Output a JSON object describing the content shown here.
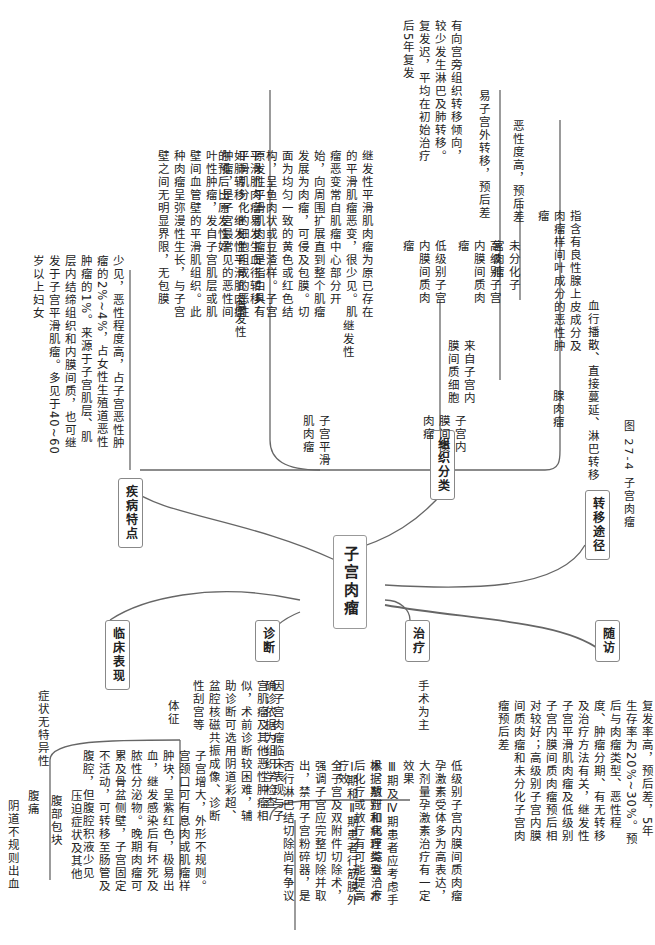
{
  "root": "子宫肉瘤",
  "caption": "图 27-4   子宫肉瘤",
  "branches": {
    "features": {
      "label": "疾病特点",
      "text": "少见，恶性程度高，占子宫恶性肿瘤的2%~4%，占女性生殖道恶性肿瘤的1%。来源于子宫肌层、肌层内结缔组织和内膜间质，也可继发于子宫平滑肌瘤。多见于40~60岁以上妇女"
    },
    "histology": {
      "label": "组织分类",
      "leiomyosarcoma": {
        "label": "子宫平滑肌肉瘤",
        "primary_label": "原发性",
        "primary_text": "原发性平滑肌肉瘤是指由具有平滑肌分化的细胞组成的恶性肿瘤，是子宫最常见的恶性间叶性肿瘤，发自子宫肌层或肌壁间血管壁的平滑肌组织。此种肉瘤呈弥漫性生长，与子宫壁之间无明显界限，无包膜",
        "secondary_label": "继发性",
        "secondary_text": "继发性平滑肌肉瘤为原已存在的平滑肌瘤恶变，很少见。肌瘤恶变常自肌瘤中心部分开始，向周围扩展直到整个肌瘤发展为肉瘤，可侵及包膜。切面为均匀一致的黄色或红色结构，呈鱼肉状或豆渣样。子宫平滑肌肉瘤易发生血行转移，如肺转移。继发性平滑肌肉瘤的预后比原发性好",
        "compare": [
          "继发性",
          "原发性好"
        ]
      },
      "stromal": {
        "label": "子宫内膜间质肉瘤",
        "origin": "来自子宫内膜间质细胞",
        "low_grade_label": "低级别子宫内膜间质肉瘤",
        "low_grade_text": "有向宫旁组织转移倾向，较少发生淋巴及肺转移。复发迟，平均在初始治疗后5年复发",
        "high_grade_label": "高级别子宫内膜间质肉瘤",
        "high_grade_text": "易子宫外转移，预后差",
        "undiff_label": "未分化子宫肉瘤",
        "undiff_text": "恶性度高，预后差"
      },
      "adenosarcoma": {
        "label": "腺肉瘤",
        "text": "指含有良性腺上皮成分及肉瘤样间叶成分的恶性肿瘤"
      }
    },
    "metastasis": {
      "label": "转移途径",
      "text": "血行播散、直接蔓延、淋巴转移"
    },
    "clinical": {
      "label": "临床表现",
      "symptoms_label": "症状无特异性",
      "symptoms": [
        "阴道不规则出血",
        "腹痛",
        "腹部包块",
        "压迫症状及其他"
      ],
      "signs_label": "体征",
      "signs_text": "子宫增大，外形不规则。宫颈口可有息肉或肌瘤样肿块，呈紫红色，极易出血，继发感染后有坏死及脓性分泌物。晚期肉瘤可累及骨盆侧壁，子宫固定不活动，可转移至肠管及腹腔，但腹腔积液少见"
    },
    "diagnosis": {
      "label": "诊断",
      "text": "因子宫肉瘤临床表现与子宫肌瘤及其他恶性肿瘤相似，术前诊断较困难，辅助诊断可选用阴道彩超、盆腔核磁共振成像、诊断性刮宫等",
      "confirm": "确诊依据为组织学检查"
    },
    "treatment": {
      "label": "治疗",
      "principle": "手术为主",
      "items": [
        "Ⅰ期和Ⅱ期患者行筋膜外全子宫及双附件切除术，强调子宫应完整切除并取出，禁用子宫粉碎器，是否行淋巴结切除尚有争议",
        "根据期别和病理类型，术后化疗或放疗有可能提高疗效",
        "Ⅲ期及Ⅳ期患者应考虑手术、放疗和化疗综合治疗",
        "低级别子宫内膜间质肉瘤孕激素受体多为高表达，大剂量孕激素治疗有一定效果"
      ]
    },
    "followup": {
      "label": "随访",
      "text": "复发率高，预后差，5年生存率为20%~30%。预后与肉瘤类型、恶性程度、肿瘤分期、有无转移及治疗方法有关，继发性子宫平滑肌肉瘤及低级别子宫内膜间质肉瘤预后相对较好；高级别子宫内膜间质肉瘤和未分化子宫肉瘤预后差"
    }
  }
}
